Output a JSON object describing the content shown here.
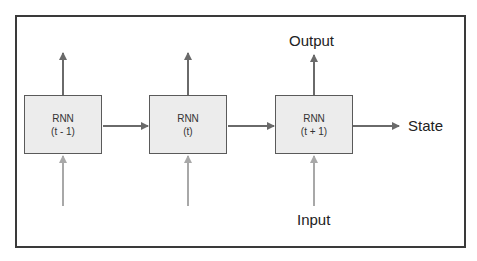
{
  "diagram": {
    "cells": [
      {
        "name": "RNN",
        "step": "(t - 1)"
      },
      {
        "name": "RNN",
        "step": "(t)"
      },
      {
        "name": "RNN",
        "step": "(t + 1)"
      }
    ],
    "labels": {
      "output": "Output",
      "input": "Input",
      "state": "State"
    },
    "colors": {
      "box_fill": "#ececec",
      "box_border": "#5a5a5a",
      "output_arrow": "#6a6a6a",
      "state_arrow": "#6a6a6a",
      "input_arrow": "#a8a8a8",
      "frame": "#3a3a3a"
    }
  }
}
